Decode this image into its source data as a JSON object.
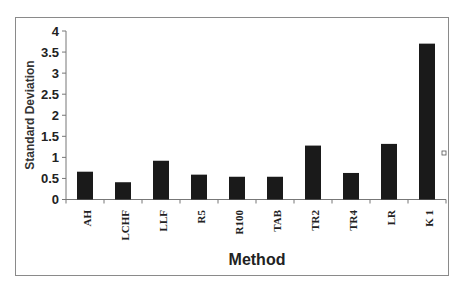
{
  "chart_data": {
    "type": "bar",
    "title": "",
    "xlabel": "Method",
    "ylabel": "Standard Deviation",
    "categories": [
      "AH",
      "LCHF",
      "LLF",
      "R5",
      "R100",
      "TAB",
      "TR2",
      "TR4",
      "LR",
      "K 1"
    ],
    "values": [
      0.66,
      0.41,
      0.92,
      0.59,
      0.54,
      0.54,
      1.28,
      0.63,
      1.32,
      3.7
    ],
    "ylim": [
      0,
      4
    ],
    "yticks": [
      "0",
      "0.5",
      "1",
      "1.5",
      "2",
      "2.5",
      "3",
      "3.5",
      "4"
    ],
    "grid": false,
    "legend": false,
    "bar_color": "#1a1a1a"
  }
}
